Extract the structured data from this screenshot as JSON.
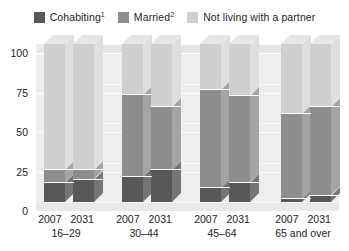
{
  "legend": {
    "items": [
      {
        "label": "Cohabiting",
        "sup": "1",
        "key": "cohabiting",
        "color": "#58585a"
      },
      {
        "label": "Married",
        "sup": "2",
        "key": "married",
        "color": "#8d8d8f"
      },
      {
        "label": "Not living with a partner",
        "sup": "",
        "key": "not_living",
        "color": "#cfcfd1"
      }
    ]
  },
  "axis": {
    "y_ticks": [
      "0",
      "25",
      "50",
      "75",
      "100"
    ],
    "x_years": [
      "2007",
      "2031"
    ],
    "age_groups": [
      "16–29",
      "30–44",
      "45–64",
      "65 and over"
    ]
  },
  "chart_data": {
    "type": "bar",
    "title": "",
    "xlabel": "",
    "ylabel": "",
    "ylim": [
      0,
      100
    ],
    "grid": true,
    "legend_position": "top",
    "stacked": true,
    "stack_total": 100,
    "categories": [
      "16–29 2007",
      "16–29 2031",
      "30–44 2007",
      "30–44 2031",
      "45–64 2007",
      "45–64 2031",
      "65 and over 2007",
      "65 and over 2031"
    ],
    "series": [
      {
        "name": "Cohabiting",
        "values": [
          12,
          14,
          16,
          20,
          9,
          12,
          2,
          4
        ]
      },
      {
        "name": "Married",
        "values": [
          8,
          6,
          52,
          40,
          62,
          55,
          54,
          56
        ]
      },
      {
        "name": "Not living with a partner",
        "values": [
          80,
          80,
          32,
          40,
          29,
          33,
          44,
          40
        ]
      }
    ],
    "groups": [
      {
        "age": "16–29",
        "bars": [
          {
            "year": "2007",
            "cohabiting": 12,
            "married": 8,
            "not_living": 80
          },
          {
            "year": "2031",
            "cohabiting": 14,
            "married": 6,
            "not_living": 80
          }
        ]
      },
      {
        "age": "30–44",
        "bars": [
          {
            "year": "2007",
            "cohabiting": 16,
            "married": 52,
            "not_living": 32
          },
          {
            "year": "2031",
            "cohabiting": 20,
            "married": 40,
            "not_living": 40
          }
        ]
      },
      {
        "age": "45–64",
        "bars": [
          {
            "year": "2007",
            "cohabiting": 9,
            "married": 62,
            "not_living": 29
          },
          {
            "year": "2031",
            "cohabiting": 12,
            "married": 55,
            "not_living": 33
          }
        ]
      },
      {
        "age": "65 and over",
        "bars": [
          {
            "year": "2007",
            "cohabiting": 2,
            "married": 54,
            "not_living": 44
          },
          {
            "year": "2031",
            "cohabiting": 4,
            "married": 56,
            "not_living": 40
          }
        ]
      }
    ]
  },
  "colors": {
    "cohabiting": "#58585a",
    "cohabiting_side": "#757577",
    "married": "#8d8d8f",
    "married_side": "#a4a4a6",
    "not_living": "#cfcfd1",
    "not_living_side": "#dedee0",
    "plot_bg": "#ededed",
    "grid": "#ffffff",
    "text": "#1d1d1d"
  }
}
